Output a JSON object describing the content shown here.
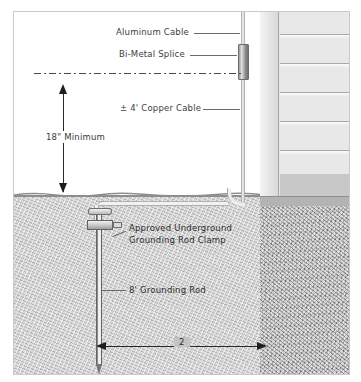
{
  "diagram": {
    "labels": {
      "aluminum_cable": "Aluminum Cable",
      "bimetal_splice": "Bi-Metal Splice",
      "copper_cable": "± 4' Copper Cable",
      "depth_dimension": "18\" Minimum",
      "clamp_line1": "Approved Underground",
      "clamp_line2": "Grounding Rod Clamp",
      "grounding_rod": "8' Grounding Rod",
      "spacing_dimension": "2"
    },
    "components": {
      "wall": "exterior-lap-siding-wall",
      "corner_trim": "corner-board",
      "soil_left": "native-soil",
      "soil_right": "gravel-aggregate-backfill",
      "grade": "finished-grade-line",
      "centerline": "grade-reference-centerline"
    },
    "colors": {
      "frame_border": "#c9c9c9",
      "soil_left": "#c3c3c3",
      "soil_right": "#bdbdbd",
      "siding": "#e8e8e8",
      "corner_board": "#e7e7e7",
      "splice_metal": "#8f8f8f",
      "rod_metal": "#efefef",
      "dimension_line": "#2b2b2b",
      "label_text": "#3d3d3d",
      "background": "#ffffff"
    }
  }
}
